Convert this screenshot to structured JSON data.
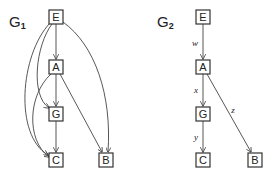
{
  "graphs": [
    {
      "id": "g1",
      "title": "G",
      "subscript": "1",
      "nodes": [
        {
          "id": "E",
          "label": "E",
          "x": 56,
          "y": 17
        },
        {
          "id": "A",
          "label": "A",
          "x": 56,
          "y": 67
        },
        {
          "id": "G",
          "label": "G",
          "x": 56,
          "y": 114
        },
        {
          "id": "C",
          "label": "C",
          "x": 56,
          "y": 160
        },
        {
          "id": "B",
          "label": "B",
          "x": 106,
          "y": 160
        }
      ],
      "edges": [
        {
          "from": "E",
          "to": "A",
          "label": ""
        },
        {
          "from": "E",
          "to": "G",
          "label": ""
        },
        {
          "from": "E",
          "to": "C",
          "label": ""
        },
        {
          "from": "E",
          "to": "B",
          "label": ""
        },
        {
          "from": "A",
          "to": "G",
          "label": ""
        },
        {
          "from": "A",
          "to": "C",
          "label": ""
        },
        {
          "from": "A",
          "to": "B",
          "label": ""
        },
        {
          "from": "G",
          "to": "C",
          "label": ""
        }
      ]
    },
    {
      "id": "g2",
      "title": "G",
      "subscript": "2",
      "nodes": [
        {
          "id": "E",
          "label": "E",
          "x": 203,
          "y": 17
        },
        {
          "id": "A",
          "label": "A",
          "x": 203,
          "y": 67
        },
        {
          "id": "G",
          "label": "G",
          "x": 203,
          "y": 114
        },
        {
          "id": "C",
          "label": "C",
          "x": 203,
          "y": 160
        },
        {
          "id": "B",
          "label": "B",
          "x": 255,
          "y": 160
        }
      ],
      "edges": [
        {
          "from": "E",
          "to": "A",
          "label": "w"
        },
        {
          "from": "A",
          "to": "G",
          "label": "x"
        },
        {
          "from": "G",
          "to": "C",
          "label": "y"
        },
        {
          "from": "A",
          "to": "B",
          "label": "z"
        }
      ]
    }
  ]
}
